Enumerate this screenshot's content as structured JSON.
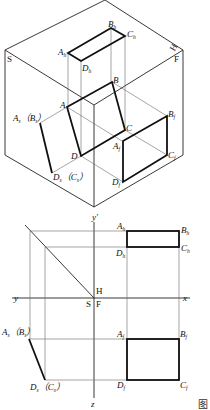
{
  "figure": {
    "caption": "图",
    "isometric_view": {
      "planes": {
        "side": "S",
        "horizontal": "H",
        "front": "F"
      },
      "plane_ABCD": [
        "A",
        "B",
        "C",
        "D"
      ],
      "horizontal_projection": {
        "A": "A",
        "B": "B",
        "C": "C",
        "D": "D",
        "sub": "h"
      },
      "front_projection": {
        "A": "A",
        "B": "B",
        "C": "C",
        "D": "D",
        "sub": "f"
      },
      "side_projection": {
        "top": [
          "A",
          "B"
        ],
        "bottom": [
          "D",
          "C"
        ],
        "sub": "s"
      },
      "axis_label": "y'"
    },
    "orthographic_view": {
      "axes": {
        "y_left": "y",
        "y_top": "y'",
        "x": "x",
        "z": "z"
      },
      "quadrant_labels": {
        "H": "H",
        "S": "S",
        "F": "F"
      },
      "horizontal_projection_labels": {
        "A": "A",
        "B": "B",
        "C": "C",
        "D": "D",
        "sub": "h"
      },
      "front_projection_labels": {
        "A": "A",
        "B": "B",
        "C": "C",
        "D": "D",
        "sub": "f"
      },
      "side_projection_labels": {
        "top": [
          "A",
          "B"
        ],
        "bottom": [
          "D",
          "C"
        ],
        "sub": "s"
      }
    }
  }
}
